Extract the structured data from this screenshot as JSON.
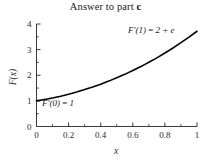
{
  "figure": {
    "title_main": "Answer to part ",
    "title_emphasis": "c"
  },
  "chart_data": {
    "type": "line",
    "title": "Answer to part c",
    "xlabel": "x",
    "ylabel": "F(x)",
    "xlim": [
      0,
      1
    ],
    "ylim": [
      0,
      4
    ],
    "grid": false,
    "legend": null,
    "xticks": [
      0,
      0.2,
      0.4,
      0.6,
      0.8,
      1
    ],
    "xtick_labels": [
      "0",
      "0.2",
      "0.4",
      "0.6",
      "0.8",
      "1"
    ],
    "yticks": [
      0,
      1,
      2,
      3,
      4
    ],
    "ytick_labels": [
      "0",
      "1",
      "2",
      "3",
      "4"
    ],
    "minor_xticks": [
      0.1,
      0.3,
      0.5,
      0.7,
      0.9
    ],
    "minor_yticks": [
      0.5,
      1.5,
      2.5,
      3.5
    ],
    "series": [
      {
        "name": "F(x) = x^2 + e^x",
        "color": "#000000",
        "linewidth": 1.6,
        "x": [
          0,
          0.05,
          0.1,
          0.15,
          0.2,
          0.25,
          0.3,
          0.35,
          0.4,
          0.45,
          0.5,
          0.55,
          0.6,
          0.65,
          0.7,
          0.75,
          0.8,
          0.85,
          0.9,
          0.95,
          1
        ],
        "y": [
          1.0,
          1.054,
          1.115,
          1.184,
          1.261,
          1.346,
          1.44,
          1.542,
          1.652,
          1.771,
          1.899,
          2.035,
          2.182,
          2.338,
          2.504,
          2.679,
          2.866,
          3.062,
          3.27,
          3.488,
          3.718
        ]
      }
    ],
    "annotations": [
      {
        "id": "derivative-at-one",
        "text": "F'(1) = 2 + e",
        "math_lhs": "F′(1)",
        "math_rhs": "2 + e",
        "x_px": 128,
        "y_px": 33
      },
      {
        "id": "derivative-at-zero",
        "text": "F'(0) = 1",
        "math_lhs": "F′(0)",
        "math_rhs": "1",
        "x_px": 42,
        "y_px": 106
      }
    ],
    "axis_color": "#3a3a3a",
    "background": "#ffffff"
  }
}
